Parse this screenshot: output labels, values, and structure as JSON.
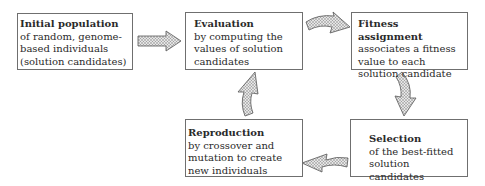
{
  "diagram": {
    "type": "cycle-flowchart",
    "nodes": [
      {
        "id": "initial",
        "title": "Initial population",
        "description": "of random, genome-based individuals (solution candidates)"
      },
      {
        "id": "evaluation",
        "title": "Evaluation",
        "description": "by computing the values of solution candidates"
      },
      {
        "id": "fitness",
        "title": "Fitness assignment",
        "description": "associates a fitness value to each solution candidate"
      },
      {
        "id": "selection",
        "title": "Selection",
        "description": "of the best-fitted solution candidates"
      },
      {
        "id": "reproduction",
        "title": "Reproduction",
        "description": "by crossover and mutation to create new individuals"
      }
    ],
    "edges": [
      {
        "from": "initial",
        "to": "evaluation"
      },
      {
        "from": "evaluation",
        "to": "fitness"
      },
      {
        "from": "fitness",
        "to": "selection"
      },
      {
        "from": "selection",
        "to": "reproduction"
      },
      {
        "from": "reproduction",
        "to": "evaluation"
      }
    ],
    "colors": {
      "border": "#6f6f6f",
      "arrow_fill": "#bdbdbd",
      "arrow_stroke": "#555555",
      "text": "#2a2a2a"
    }
  }
}
